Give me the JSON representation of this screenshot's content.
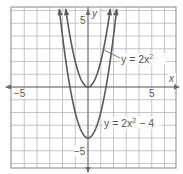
{
  "chart_data": {
    "type": "line",
    "title": "",
    "xlabel": "x",
    "ylabel": "y",
    "xlim": [
      -6,
      7
    ],
    "ylim": [
      -6.3,
      6.3
    ],
    "grid": true,
    "tick_labels": {
      "x": [
        {
          "value": -5,
          "label": "−5"
        },
        {
          "value": 5,
          "label": "5"
        }
      ],
      "y": [
        {
          "value": 5,
          "label": "5"
        },
        {
          "value": -5,
          "label": "−5"
        }
      ]
    },
    "series": [
      {
        "name": "y = 2x^2",
        "label_main": "y = 2x",
        "label_sup": "2",
        "label_tail": "",
        "a": 2,
        "c": 0,
        "vertex": [
          0,
          0
        ],
        "arrows": "both-ends-up"
      },
      {
        "name": "y = 2x^2 - 4",
        "label_main": "y = 2x",
        "label_sup": "2",
        "label_tail": " − 4",
        "a": 2,
        "c": -4,
        "vertex": [
          0,
          -4
        ],
        "arrows": "both-ends-up"
      }
    ],
    "annotations": [
      {
        "text": "y = 2x²",
        "points_to": "upper parabola",
        "position": [
          3.8,
          2.2
        ]
      },
      {
        "text": "y = 2x² − 4",
        "points_to": "lower parabola",
        "position": [
          3.5,
          -3.3
        ]
      }
    ]
  },
  "labels": {
    "x_axis": "x",
    "y_axis": "y",
    "x_neg5": "−5",
    "x_pos5": "5",
    "y_pos5": "5",
    "y_neg5": "−5",
    "curve1_main": "y = 2x",
    "curve1_sup": "2",
    "curve2_main": "y = 2x",
    "curve2_sup": "2",
    "curve2_tail": " − 4"
  },
  "colors": {
    "curve": "#5a5a5a",
    "grid": "#b8b8b8",
    "axis": "#6a6a6a",
    "text": "#555555"
  }
}
